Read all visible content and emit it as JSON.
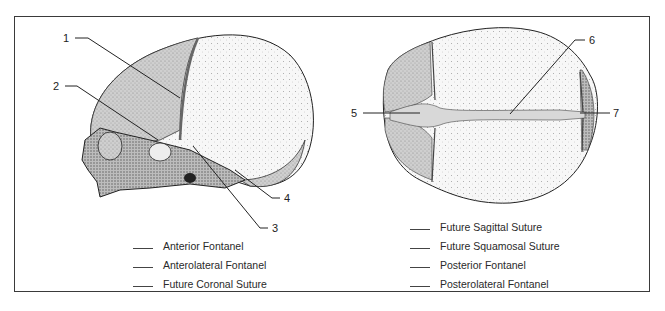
{
  "figure": {
    "left_view": {
      "name": "lateral view of fetal skull",
      "callouts": [
        "1",
        "2",
        "3",
        "4"
      ]
    },
    "right_view": {
      "name": "superior view of fetal skull",
      "callouts": [
        "5",
        "6",
        "7"
      ]
    },
    "legend_left": [
      {
        "label": "Anterior Fontanel"
      },
      {
        "label": "Anterolateral Fontanel"
      },
      {
        "label": "Future Coronal Suture"
      }
    ],
    "legend_right": [
      {
        "label": "Future Sagittal Suture"
      },
      {
        "label": "Future Squamosal Suture"
      },
      {
        "label": "Posterior Fontanel"
      },
      {
        "label": "Posterolateral Fontanel"
      }
    ]
  }
}
